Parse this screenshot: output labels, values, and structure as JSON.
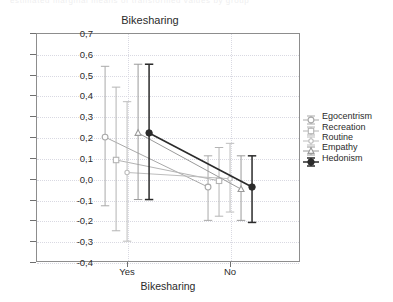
{
  "top_partial_text": "estimated marginal means of transformed values by group",
  "chart_data": {
    "type": "line",
    "title": "Bikesharing",
    "subtitle": "",
    "xlabel": "Bikesharing",
    "ylabel": "",
    "categories": [
      "Yes",
      "No"
    ],
    "ylim": [
      -0.4,
      0.7
    ],
    "ytick_labels": [
      "0,7",
      "0,6",
      "0,5",
      "0,4",
      "0,3",
      "0,2",
      "0,1",
      "0,0",
      "-0,1",
      "-0,2",
      "-0,3",
      "-0,4"
    ],
    "ytick_values": [
      0.7,
      0.6,
      0.5,
      0.4,
      0.3,
      0.2,
      0.1,
      0.0,
      -0.1,
      -0.2,
      -0.3,
      -0.4
    ],
    "grid": true,
    "legend_position": "right",
    "error_bars": "confidence-interval",
    "series": [
      {
        "name": "Egocentrism",
        "marker": "circle-open",
        "color": "#a9a9a9",
        "values": [
          0.2,
          -0.04
        ],
        "ci_low": [
          -0.13,
          -0.2
        ],
        "ci_high": [
          0.54,
          0.11
        ]
      },
      {
        "name": "Recreation",
        "marker": "square-open",
        "color": "#b4b4b4",
        "values": [
          0.09,
          -0.01
        ],
        "ci_low": [
          -0.25,
          -0.18
        ],
        "ci_high": [
          0.44,
          0.15
        ]
      },
      {
        "name": "Routine",
        "marker": "circle-small",
        "color": "#bdbdbd",
        "values": [
          0.03,
          0.0
        ],
        "ci_low": [
          -0.3,
          -0.16
        ],
        "ci_high": [
          0.37,
          0.17
        ]
      },
      {
        "name": "Empathy",
        "marker": "triangle",
        "color": "#9a9a9a",
        "values": [
          0.22,
          -0.05
        ],
        "ci_low": [
          -0.1,
          -0.2
        ],
        "ci_high": [
          0.55,
          0.11
        ]
      },
      {
        "name": "Hedonism",
        "marker": "circle-filled",
        "color": "#2b2b2b",
        "values": [
          0.22,
          -0.04
        ],
        "ci_low": [
          -0.1,
          -0.21
        ],
        "ci_high": [
          0.55,
          0.11
        ]
      }
    ]
  }
}
